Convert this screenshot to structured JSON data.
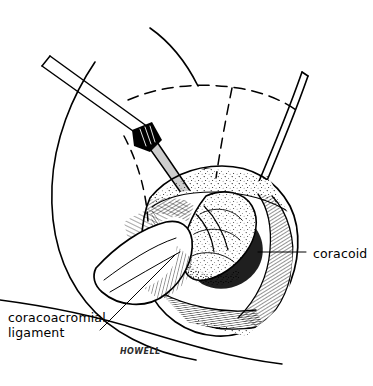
{
  "figure": {
    "background_color": "#ffffff",
    "ink_color": "#000000",
    "width": 373,
    "height": 386
  },
  "labels": {
    "ligament": {
      "line1": "coracoacromial",
      "line2": "ligament",
      "leader": "diagonal leader line from label up-right to ligament flap"
    },
    "coracoid": {
      "text": "coracoid",
      "leader": "horizontal leader line from label left to coracoid bone"
    }
  },
  "signature": {
    "text": "HOWELL"
  },
  "anatomy": {
    "structures": [
      "shoulder skin contour",
      "dashed acromion landmark",
      "dashed clavicle landmark",
      "surgical wound edges",
      "coracoid process",
      "coracoacromial ligament flap",
      "deltoid muscle fibers",
      "retractor blade",
      "surgical elevator instrument"
    ]
  }
}
